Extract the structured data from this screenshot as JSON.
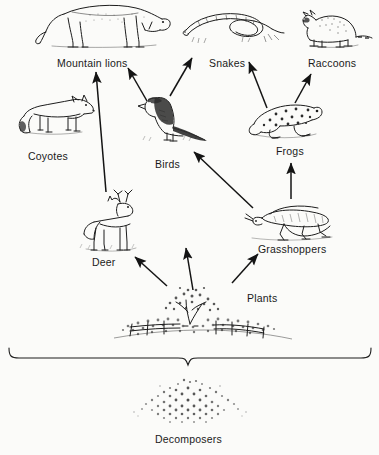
{
  "diagram": {
    "background_color": "#fbfbf9",
    "ink_color": "#1a1a1a",
    "style": "pen-and-ink scientific illustration"
  },
  "nodes": [
    {
      "id": "mountain-lions",
      "label": "Mountain lions",
      "icon": "mountain-lion-illustration",
      "label_x": 57,
      "label_y": 57,
      "trophic_level": "tertiary consumer"
    },
    {
      "id": "snakes",
      "label": "Snakes",
      "icon": "snake-illustration",
      "label_x": 209,
      "label_y": 57,
      "trophic_level": "tertiary consumer"
    },
    {
      "id": "raccoons",
      "label": "Raccoons",
      "icon": "raccoon-illustration",
      "label_x": 308,
      "label_y": 57,
      "trophic_level": "tertiary consumer"
    },
    {
      "id": "coyotes",
      "label": "Coyotes",
      "icon": "coyote-illustration",
      "label_x": 28,
      "label_y": 150,
      "trophic_level": "tertiary consumer"
    },
    {
      "id": "birds",
      "label": "Birds",
      "icon": "bird-illustration",
      "label_x": 155,
      "label_y": 158,
      "trophic_level": "secondary consumer"
    },
    {
      "id": "frogs",
      "label": "Frogs",
      "icon": "frog-illustration",
      "label_x": 276,
      "label_y": 145,
      "trophic_level": "secondary consumer"
    },
    {
      "id": "deer",
      "label": "Deer",
      "icon": "deer-illustration",
      "label_x": 92,
      "label_y": 256,
      "trophic_level": "primary consumer"
    },
    {
      "id": "grasshoppers",
      "label": "Grasshoppers",
      "icon": "grasshopper-illustration",
      "label_x": 258,
      "label_y": 243,
      "trophic_level": "primary consumer"
    },
    {
      "id": "plants",
      "label": "Plants",
      "icon": "plants-illustration",
      "label_x": 247,
      "label_y": 292,
      "trophic_level": "producer"
    },
    {
      "id": "decomposers",
      "label": "Decomposers",
      "icon": "decomposers-illustration",
      "label_x": 155,
      "label_y": 433,
      "trophic_level": "decomposer"
    }
  ],
  "arrows": [
    {
      "id": "deer-to-mountain-lions",
      "from": "deer",
      "to": "mountain-lions",
      "x1": 106,
      "y1": 192,
      "x2": 96,
      "y2": 72
    },
    {
      "id": "birds-to-mountain-lions",
      "from": "birds",
      "to": "mountain-lions",
      "x1": 147,
      "y1": 101,
      "x2": 128,
      "y2": 68
    },
    {
      "id": "birds-to-snakes",
      "from": "birds",
      "to": "snakes",
      "x1": 170,
      "y1": 96,
      "x2": 192,
      "y2": 58
    },
    {
      "id": "frogs-to-snakes",
      "from": "frogs",
      "to": "snakes",
      "x1": 267,
      "y1": 108,
      "x2": 249,
      "y2": 62
    },
    {
      "id": "frogs-to-raccoons",
      "from": "frogs",
      "to": "raccoons",
      "x1": 295,
      "y1": 103,
      "x2": 311,
      "y2": 74
    },
    {
      "id": "grasshoppers-to-frogs",
      "from": "grasshoppers",
      "to": "frogs",
      "x1": 291,
      "y1": 199,
      "x2": 291,
      "y2": 163
    },
    {
      "id": "grasshoppers-to-birds",
      "from": "grasshoppers",
      "to": "birds",
      "x1": 253,
      "y1": 208,
      "x2": 194,
      "y2": 152
    },
    {
      "id": "plants-to-deer",
      "from": "plants",
      "to": "deer",
      "x1": 167,
      "y1": 286,
      "x2": 135,
      "y2": 257
    },
    {
      "id": "plants-to-birds",
      "from": "plants",
      "to": "birds",
      "x1": 193,
      "y1": 290,
      "x2": 186,
      "y2": 248
    },
    {
      "id": "plants-to-grasshoppers",
      "from": "plants",
      "to": "grasshoppers",
      "x1": 232,
      "y1": 283,
      "x2": 258,
      "y2": 254
    }
  ],
  "brace": {
    "id": "decomposers-brace",
    "left_x": 8,
    "right_x": 372,
    "y": 356,
    "center_x": 188,
    "description": "large horizontal brace grouping all organisms above, pointing down to Decomposers"
  }
}
